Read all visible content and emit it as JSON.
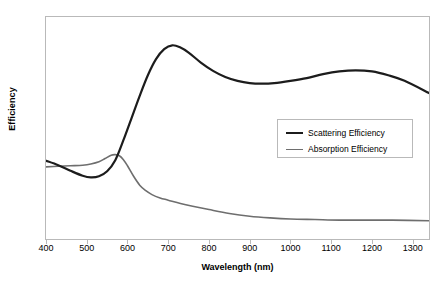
{
  "chart_data": {
    "type": "line",
    "title": "",
    "xlabel": "Wavelength (nm)",
    "ylabel": "Efficiency",
    "xlim": [
      400,
      1340
    ],
    "ylim": [
      0.0,
      4.0
    ],
    "grid": false,
    "legend_position": "center-right",
    "xticks": [
      400,
      500,
      600,
      700,
      800,
      900,
      1000,
      1100,
      1200,
      1300
    ],
    "xtick_labels": [
      "400",
      "500",
      "600",
      "700",
      "800",
      "900",
      "1000",
      "1100",
      "1200",
      "1300"
    ],
    "yticks": [
      0.0,
      0.5,
      1.0,
      1.5,
      2.0,
      2.5,
      3.0,
      3.5,
      4.0
    ],
    "ytick_labels": [
      "0.00",
      "0.50",
      "1.00",
      "1.50",
      "2.00",
      "2.50",
      "3.00",
      "3.50",
      "4.00"
    ],
    "series": [
      {
        "name": "Scattering Efficiency",
        "color": "#1c1c1c",
        "width": 2.2,
        "x": [
          400,
          430,
          460,
          490,
          510,
          530,
          550,
          570,
          590,
          610,
          630,
          650,
          670,
          690,
          710,
          730,
          750,
          780,
          810,
          840,
          870,
          900,
          930,
          960,
          1000,
          1040,
          1080,
          1120,
          1160,
          1200,
          1240,
          1280,
          1340
        ],
        "y": [
          1.41,
          1.33,
          1.23,
          1.14,
          1.11,
          1.13,
          1.22,
          1.42,
          1.78,
          2.18,
          2.58,
          2.95,
          3.24,
          3.42,
          3.49,
          3.45,
          3.36,
          3.18,
          3.03,
          2.92,
          2.85,
          2.81,
          2.8,
          2.81,
          2.85,
          2.9,
          2.97,
          3.02,
          3.04,
          3.02,
          2.95,
          2.85,
          2.63
        ]
      },
      {
        "name": "Absorption Efficiency",
        "color": "#6e6e6e",
        "width": 1.6,
        "x": [
          400,
          430,
          460,
          490,
          510,
          530,
          545,
          560,
          570,
          580,
          590,
          600,
          615,
          630,
          645,
          660,
          680,
          700,
          730,
          760,
          800,
          850,
          900,
          950,
          1000,
          1060,
          1120,
          1180,
          1250,
          1340
        ],
        "y": [
          1.3,
          1.31,
          1.32,
          1.33,
          1.35,
          1.39,
          1.45,
          1.51,
          1.52,
          1.5,
          1.43,
          1.32,
          1.13,
          0.97,
          0.87,
          0.8,
          0.74,
          0.7,
          0.64,
          0.59,
          0.53,
          0.46,
          0.41,
          0.38,
          0.36,
          0.35,
          0.34,
          0.34,
          0.34,
          0.33
        ]
      }
    ],
    "annotations": {
      "scattering_peak": {
        "x": 710,
        "y": 3.49
      },
      "scattering_min": {
        "x": 510,
        "y": 1.11
      },
      "scattering_secondary_peak": {
        "x": 1150,
        "y": 3.04
      },
      "absorption_peak": {
        "x": 570,
        "y": 1.52
      }
    }
  },
  "legend": {
    "entries": [
      {
        "label": "Scattering Efficiency"
      },
      {
        "label": "Absorption Efficiency"
      }
    ]
  }
}
